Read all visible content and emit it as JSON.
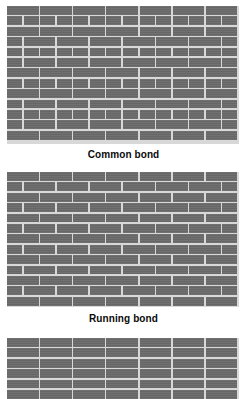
{
  "figure": {
    "background_color": "#ffffff",
    "brick_color": "#6b6b6b",
    "mortar_color": "#d8d8d8",
    "label_color": "#0a0a0a"
  },
  "panels": [
    {
      "id": "common",
      "caption": "Common bond",
      "pattern": "common-bond",
      "description": "Stretcher courses with a header course of short bricks every third course",
      "courses": 13,
      "columns_per_stretcher_course": 7,
      "header_course_interval": 3
    },
    {
      "id": "running",
      "caption": "Running bond",
      "pattern": "running-bond",
      "description": "Uniform stretcher courses each offset one half brick",
      "courses": 13,
      "columns_per_course": 7,
      "offset": "half-brick"
    },
    {
      "id": "stack",
      "caption": "",
      "pattern": "stack-bond",
      "description": "Stretchers aligned with continuous vertical head joints",
      "courses": 6,
      "columns_per_course": 7,
      "offset": "none"
    }
  ]
}
